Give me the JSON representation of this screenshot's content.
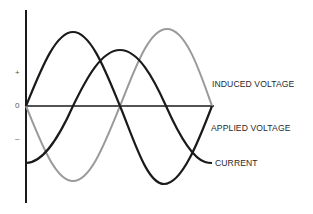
{
  "figure": {
    "axis_labels": {
      "plus": "+",
      "zero": "0",
      "minus": "–"
    },
    "curves": [
      {
        "name": "INDUCED VOLTAGE",
        "color": "#9a9a9a",
        "phase": "lags applied voltage by 180°",
        "start": "zero, decreasing"
      },
      {
        "name": "APPLIED VOLTAGE",
        "color": "#1a1a1a",
        "phase": "reference",
        "start": "zero, increasing"
      },
      {
        "name": "CURRENT",
        "color": "#1a1a1a",
        "phase": "lags applied voltage by 90°",
        "start": "negative minimum"
      }
    ],
    "labels": {
      "induced": "INDUCED VOLTAGE",
      "applied": "APPLIED VOLTAGE",
      "current": "CURRENT"
    },
    "colors": {
      "axis": "#1a1a1a",
      "dark_curve": "#1a1a1a",
      "light_curve": "#9a9a9a",
      "text": "#2a2a2a"
    }
  }
}
